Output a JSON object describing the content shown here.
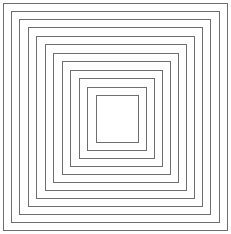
{
  "figure": {
    "type": "concentric-nested-squares",
    "background_color": "#ffffff",
    "canvas": {
      "width": 231,
      "height": 234
    },
    "stroke_color": "#6e6e6e",
    "stroke_width": 1,
    "ring_count": 12,
    "squares": [
      {
        "index": 1,
        "x": 3.0,
        "y": 3.0,
        "width": 224.0,
        "height": 227.0,
        "name": "square-ring-1-outermost"
      },
      {
        "index": 2,
        "x": 11.0,
        "y": 11.0,
        "width": 208.0,
        "height": 211.0,
        "name": "square-ring-2"
      },
      {
        "index": 3,
        "x": 19.5,
        "y": 19.0,
        "width": 191.0,
        "height": 195.0,
        "name": "square-ring-3"
      },
      {
        "index": 4,
        "x": 28.0,
        "y": 27.5,
        "width": 174.5,
        "height": 178.5,
        "name": "square-ring-4"
      },
      {
        "index": 5,
        "x": 36.5,
        "y": 36.0,
        "width": 158.0,
        "height": 162.0,
        "name": "square-ring-5"
      },
      {
        "index": 6,
        "x": 45.0,
        "y": 44.5,
        "width": 141.5,
        "height": 145.5,
        "name": "square-ring-6"
      },
      {
        "index": 7,
        "x": 53.5,
        "y": 53.0,
        "width": 125.0,
        "height": 129.0,
        "name": "square-ring-7"
      },
      {
        "index": 8,
        "x": 62.0,
        "y": 61.5,
        "width": 108.5,
        "height": 112.5,
        "name": "square-ring-8"
      },
      {
        "index": 9,
        "x": 70.5,
        "y": 70.0,
        "width": 92.0,
        "height": 96.0,
        "name": "square-ring-9"
      },
      {
        "index": 10,
        "x": 79.0,
        "y": 78.5,
        "width": 75.5,
        "height": 79.5,
        "name": "square-ring-10"
      },
      {
        "index": 11,
        "x": 87.5,
        "y": 87.0,
        "width": 59.0,
        "height": 63.0,
        "name": "square-ring-11"
      },
      {
        "index": 12,
        "x": 96.0,
        "y": 95.5,
        "width": 42.5,
        "height": 46.5,
        "name": "square-ring-12-innermost"
      }
    ]
  },
  "chart_data": {
    "type": "line",
    "xlabel": "",
    "ylabel": "",
    "categories": [
      "ring-1",
      "ring-2",
      "ring-3",
      "ring-4",
      "ring-5",
      "ring-6",
      "ring-7",
      "ring-8",
      "ring-9",
      "ring-10",
      "ring-11",
      "ring-12"
    ],
    "values": [
      224.0,
      208.0,
      191.0,
      174.5,
      158.0,
      141.5,
      125.0,
      108.5,
      92.0,
      75.5,
      59.0,
      42.5
    ],
    "series": [
      {
        "name": "square side width (px)",
        "values": [
          224.0,
          208.0,
          191.0,
          174.5,
          158.0,
          141.5,
          125.0,
          108.5,
          92.0,
          75.5,
          59.0,
          42.5
        ]
      },
      {
        "name": "square side height (px)",
        "values": [
          227.0,
          211.0,
          195.0,
          178.5,
          162.0,
          145.5,
          129.0,
          112.5,
          96.0,
          79.5,
          63.0,
          46.5
        ]
      }
    ],
    "xlim": [
      1,
      12
    ],
    "ylim": [
      0,
      231
    ],
    "grid": false,
    "legend": "none"
  }
}
